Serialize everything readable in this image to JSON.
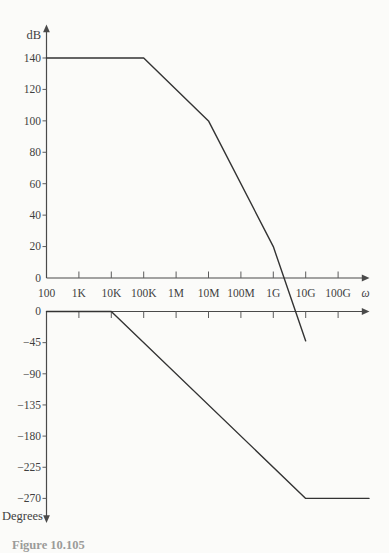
{
  "figure": {
    "caption_partial": "Figure 10.105"
  },
  "magnitude_plot": {
    "y_axis_label": "dB",
    "y_ticks": [
      140,
      120,
      100,
      80,
      60,
      40,
      20,
      0
    ]
  },
  "freq_axis": {
    "tick_labels": [
      "100",
      "1K",
      "10K",
      "100K",
      "1M",
      "10M",
      "100M",
      "1G",
      "10G",
      "100G"
    ],
    "end_label": "ω"
  },
  "phase_plot": {
    "y_axis_label": "Degrees",
    "y_ticks": [
      0,
      -45,
      -90,
      -135,
      -180,
      -225,
      -270
    ]
  },
  "chart_data": [
    {
      "type": "line",
      "subplot": "magnitude",
      "title": "",
      "xlabel": "ω",
      "ylabel": "dB",
      "x_scale": "log",
      "x_tick_labels": [
        "100",
        "1K",
        "10K",
        "100K",
        "1M",
        "10M",
        "100M",
        "1G",
        "10G",
        "100G"
      ],
      "x": [
        100,
        100000,
        10000000,
        1000000000,
        10000000000
      ],
      "y_dB": [
        140,
        140,
        100,
        20,
        -40
      ],
      "segment_slopes_dB_per_decade": [
        0,
        -20,
        -40,
        -60
      ],
      "zero_dB_crossing_x_approx": 2200000000,
      "y_axis_tick_range": [
        0,
        140
      ],
      "grid": false,
      "legend": "none"
    },
    {
      "type": "line",
      "subplot": "phase",
      "title": "",
      "xlabel": "ω",
      "ylabel": "Degrees",
      "x_scale": "log",
      "x": [
        100,
        10000,
        10000000000
      ],
      "y_degrees": [
        0,
        0,
        -270
      ],
      "flat_tail_right": true,
      "segment_slopes_deg_per_decade": [
        0,
        -45,
        0
      ],
      "y_axis_tick_range": [
        -270,
        0
      ],
      "grid": false,
      "legend": "none"
    }
  ]
}
